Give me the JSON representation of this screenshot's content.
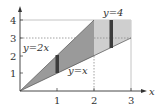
{
  "diagram": {
    "type": "region-integration-sketch",
    "axes": {
      "x_label": "x",
      "x_ticks": [
        "1",
        "2",
        "3"
      ],
      "y_ticks": [
        "1",
        "2",
        "3",
        "4"
      ]
    },
    "curves": [
      {
        "id": "upper-line",
        "label": "y=2x"
      },
      {
        "id": "lower-line",
        "label": "y=x"
      },
      {
        "id": "top-line",
        "label": "y=4"
      }
    ],
    "regions": [
      {
        "id": "region-left",
        "description": "between y=x and y=2x for 0≤x≤2",
        "color": "#9a9a9a"
      },
      {
        "id": "region-right",
        "description": "between y=x and y=4 for 2≤x≤3",
        "color": "#cfcfcf"
      }
    ],
    "strips": [
      {
        "id": "strip-left",
        "x": 1,
        "color": "#3c3c3c"
      },
      {
        "id": "strip-right",
        "x": 2.45,
        "color": "#3c3c3c"
      }
    ]
  }
}
